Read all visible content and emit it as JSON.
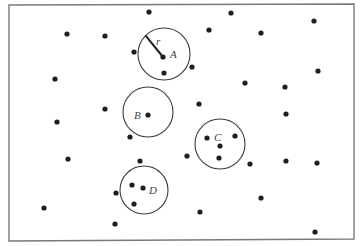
{
  "diagram": {
    "type": "point-pattern-neighborhoods",
    "frame": {
      "x1": 9,
      "y1": 5,
      "x2": 354,
      "y2": 239
    },
    "radius_label": "r",
    "circles": [
      {
        "label": "A",
        "cx": 164,
        "cy": 54,
        "r": 26,
        "label_dx": 6,
        "label_dy": 4,
        "show_radius": true
      },
      {
        "label": "B",
        "cx": 148,
        "cy": 112,
        "r": 25,
        "label_dx": -14,
        "label_dy": 7
      },
      {
        "label": "C",
        "cx": 220,
        "cy": 144,
        "r": 25,
        "label_dx": -6,
        "label_dy": -3
      },
      {
        "label": "D",
        "cx": 144,
        "cy": 190,
        "r": 24,
        "label_dx": 5,
        "label_dy": 4
      }
    ],
    "points": [
      [
        149,
        12
      ],
      [
        67,
        34
      ],
      [
        105,
        36
      ],
      [
        134,
        52
      ],
      [
        163,
        57
      ],
      [
        164,
        73
      ],
      [
        55,
        79
      ],
      [
        105,
        109
      ],
      [
        148,
        115
      ],
      [
        57,
        122
      ],
      [
        231,
        13
      ],
      [
        314,
        21
      ],
      [
        209,
        30
      ],
      [
        261,
        33
      ],
      [
        192,
        67
      ],
      [
        318,
        71
      ],
      [
        245,
        83
      ],
      [
        285,
        87
      ],
      [
        199,
        104
      ],
      [
        286,
        114
      ],
      [
        130,
        137
      ],
      [
        68,
        159
      ],
      [
        140,
        161
      ],
      [
        132,
        185
      ],
      [
        143,
        188
      ],
      [
        116,
        193
      ],
      [
        134,
        204
      ],
      [
        44,
        208
      ],
      [
        115,
        224
      ],
      [
        207,
        138
      ],
      [
        235,
        136
      ],
      [
        220,
        146
      ],
      [
        187,
        156
      ],
      [
        219,
        158
      ],
      [
        250,
        164
      ],
      [
        286,
        161
      ],
      [
        317,
        163
      ],
      [
        261,
        198
      ],
      [
        200,
        212
      ],
      [
        315,
        232
      ]
    ]
  }
}
